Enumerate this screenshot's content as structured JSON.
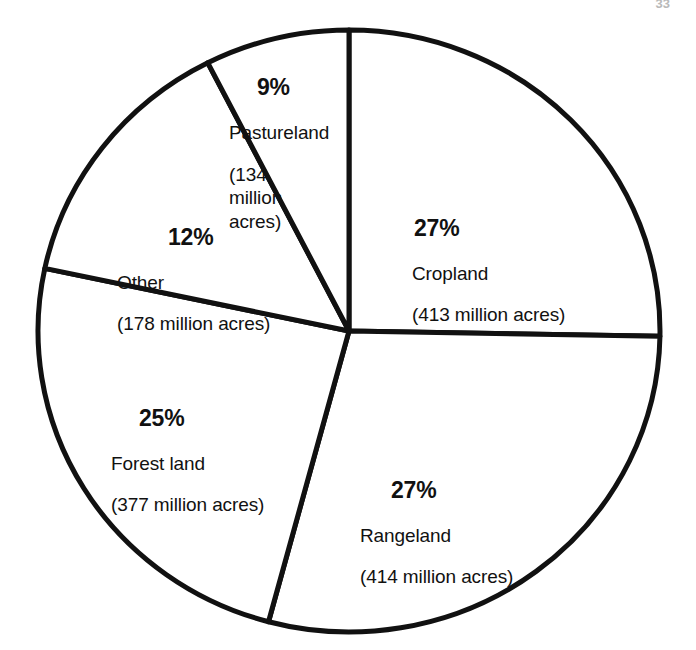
{
  "page": {
    "page_number": "33",
    "background_color": "#ffffff",
    "line_color": "#111111"
  },
  "chart_data": {
    "type": "pie",
    "title": "",
    "subtitle": "",
    "xlabel": "",
    "ylabel": "",
    "legend_position": "none",
    "grid": false,
    "units": "million acres",
    "total_percent": 100,
    "total_value": 1516,
    "categories": [
      "Cropland",
      "Rangeland",
      "Forest land",
      "Other",
      "Pastureland"
    ],
    "values": [
      27,
      27,
      25,
      12,
      9
    ],
    "absolute_values": [
      413,
      414,
      377,
      178,
      134
    ],
    "slices": [
      {
        "label": "Cropland",
        "percent": 27,
        "percent_text": "27%",
        "value": 413,
        "amount_text": "(413 million acres)",
        "start_angle": 0,
        "end_angle": 91,
        "label_x": 412,
        "label_y": 196
      },
      {
        "label": "Rangeland",
        "percent": 27,
        "percent_text": "27%",
        "value": 414,
        "amount_text": "(414 million acres)",
        "start_angle": 91,
        "end_angle": 195,
        "label_x": 360,
        "label_y": 458
      },
      {
        "label": "Forest land",
        "percent": 25,
        "percent_text": "25%",
        "value": 377,
        "amount_text": "(377 million acres)",
        "start_angle": 195,
        "end_angle": 282,
        "label_x": 111,
        "label_y": 386
      },
      {
        "label": "Other",
        "percent": 12,
        "percent_text": "12%",
        "value": 178,
        "amount_text": "(178 million acres)",
        "start_angle": 282,
        "end_angle": 333,
        "label_x": 117,
        "label_y": 205
      },
      {
        "label": "Pastureland",
        "percent": 9,
        "percent_text": "9%",
        "value": 134,
        "amount_text": "(134\nmillion\nacres)",
        "start_angle": 333,
        "end_angle": 360,
        "label_x": 229,
        "label_y": 55
      }
    ]
  }
}
